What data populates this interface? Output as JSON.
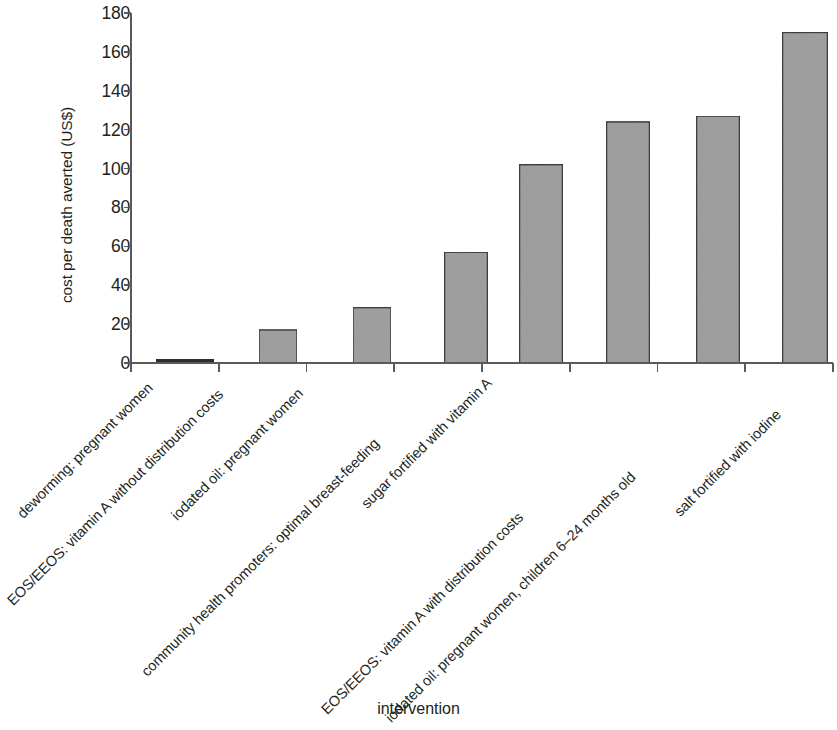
{
  "chart_data": {
    "type": "bar",
    "title": "",
    "subtitle": "",
    "xlabel": "intervention",
    "ylabel": "cost per death averted (US$)",
    "ylim": [
      0,
      180
    ],
    "yticks": [
      0,
      20,
      40,
      60,
      80,
      100,
      120,
      140,
      160,
      180
    ],
    "ytick_labels": [
      "0",
      "20",
      "40",
      "60",
      "80",
      "100",
      "120",
      "140",
      "160",
      "180"
    ],
    "grid": false,
    "legend": null,
    "legend_position": "none",
    "bar_color": "#a3a3a3",
    "bar_edge_color": "#3f3f3f",
    "axis_color": "#5a5a5a",
    "categories": [
      "deworming: pregnant women",
      "EOS/EEOS: vitamin A without distribution costs",
      "iodated oil: pregnant women",
      "community health promoters: optimal breast-feeding",
      "sugar fortified with vitamin A",
      "EOS/EEOS: vitamin A with distribution costs",
      "iodated oil: pregnant women, children 6–24 months old",
      "salt fortified with iodine"
    ],
    "values": [
      1,
      17,
      28.5,
      57,
      102,
      124,
      127,
      170
    ],
    "series": [
      {
        "name": "cost per death averted (US$)",
        "values": [
          1,
          17,
          28.5,
          57,
          102,
          124,
          127,
          170
        ]
      }
    ]
  },
  "axes": {
    "y_title": "cost per death averted (US$)",
    "x_title": "intervention"
  }
}
